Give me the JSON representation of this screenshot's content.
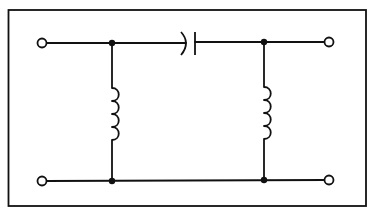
{
  "diagram": {
    "type": "circuit-schematic",
    "colors": {
      "ink": "#111111",
      "background": "#ffffff"
    },
    "components": [
      {
        "id": "C1",
        "kind": "capacitor",
        "placement": "series",
        "position": "top rail, center"
      },
      {
        "id": "L1",
        "kind": "inductor",
        "placement": "shunt",
        "position": "left",
        "turns": 4
      },
      {
        "id": "L2",
        "kind": "inductor",
        "placement": "shunt",
        "position": "right",
        "turns": 4
      }
    ],
    "terminals": [
      {
        "id": "in-top",
        "position": "top-left"
      },
      {
        "id": "in-bottom",
        "position": "bottom-left"
      },
      {
        "id": "out-top",
        "position": "top-right"
      },
      {
        "id": "out-bottom",
        "position": "bottom-right"
      }
    ],
    "junctions": [
      {
        "id": "J1",
        "position": "top-left rail"
      },
      {
        "id": "J2",
        "position": "top-right rail"
      },
      {
        "id": "J3",
        "position": "bottom-left rail"
      },
      {
        "id": "J4",
        "position": "bottom-right rail"
      }
    ]
  }
}
